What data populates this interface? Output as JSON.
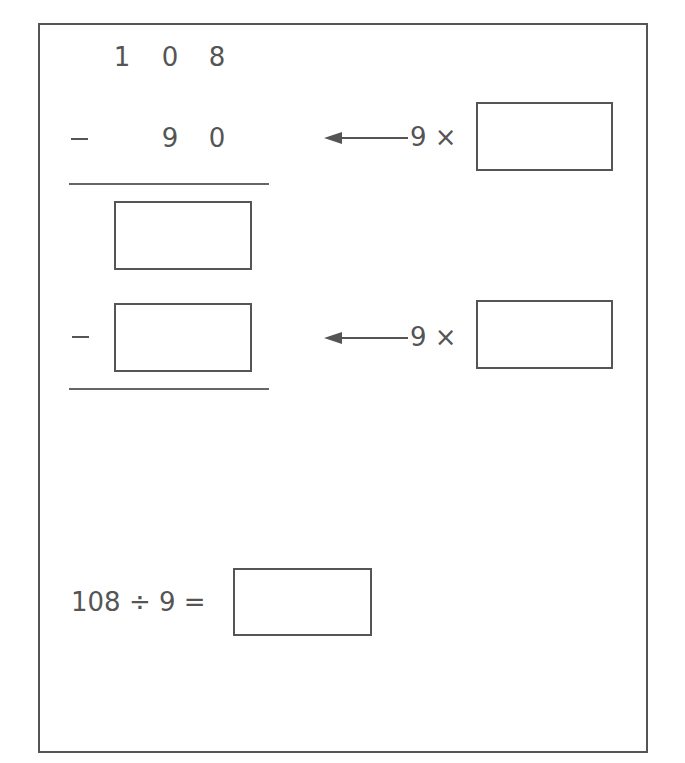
{
  "problem": {
    "dividend_digits": [
      "1",
      "0",
      "8"
    ],
    "step1": {
      "operator": "−",
      "subtrahend_digits": [
        "9",
        "0"
      ],
      "multiplier_label": "9 ×",
      "multiplier_answer": ""
    },
    "remainder1_answer": "",
    "step2": {
      "operator": "−",
      "subtrahend_answer": "",
      "multiplier_label": "9 ×",
      "multiplier_answer": ""
    },
    "final_equation": {
      "expression": "108 ÷ 9 =",
      "answer": ""
    }
  },
  "colors": {
    "ink": "#555555",
    "background": "#ffffff"
  }
}
